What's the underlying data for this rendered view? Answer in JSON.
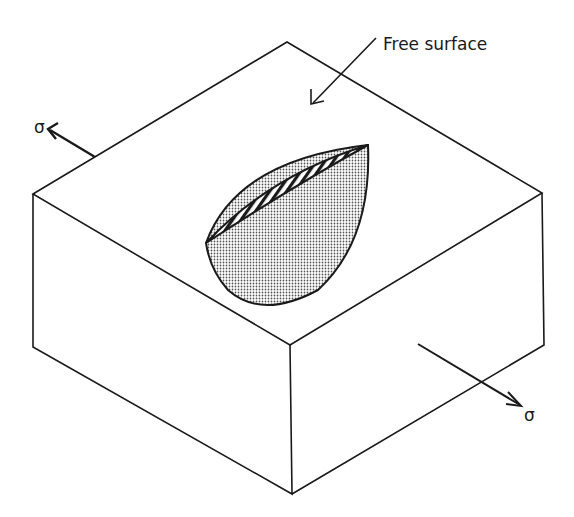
{
  "figure": {
    "type": "isometric block with semi-elliptical surface crack",
    "labels": {
      "free_surface": "Free surface",
      "stress_left": "σ",
      "stress_right": "σ"
    },
    "colors": {
      "line": "#1a1a1a",
      "background": "#ffffff",
      "crack_fill": "#bdbdbd"
    }
  }
}
